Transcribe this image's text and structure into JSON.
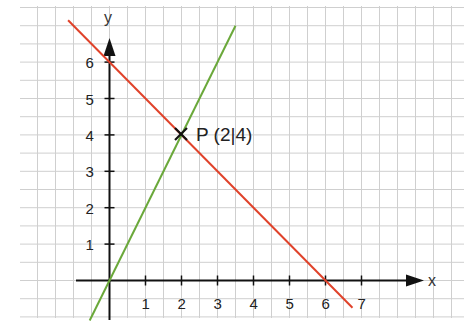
{
  "chart_data": {
    "type": "line",
    "title": "",
    "xlabel": "x",
    "ylabel": "y",
    "xlim": [
      -1,
      9
    ],
    "ylim": [
      -1,
      7
    ],
    "grid": true,
    "grid_step": 0.5,
    "x_ticks": [
      "1",
      "2",
      "3",
      "4",
      "5",
      "6",
      "7"
    ],
    "y_ticks": [
      "1",
      "2",
      "3",
      "4",
      "5",
      "6"
    ],
    "series": [
      {
        "name": "red line",
        "equation": "y = -x + 6",
        "color": "#e0422a",
        "x": [
          -1.15,
          6.75
        ],
        "y": [
          7.15,
          -0.75
        ]
      },
      {
        "name": "green line",
        "equation": "y = 2x",
        "color": "#6aa83a",
        "x": [
          -0.55,
          3.5
        ],
        "y": [
          -1.1,
          7.0
        ]
      }
    ],
    "annotations": [
      {
        "label": "P (2|4)",
        "x": 2,
        "y": 4,
        "marker": "x"
      }
    ]
  },
  "labels": {
    "x_axis": "x",
    "y_axis": "y",
    "point": "P (2|4)",
    "x_ticks": [
      "1",
      "2",
      "3",
      "4",
      "5",
      "6",
      "7"
    ],
    "y_ticks": [
      "1",
      "2",
      "3",
      "4",
      "5",
      "6"
    ]
  }
}
